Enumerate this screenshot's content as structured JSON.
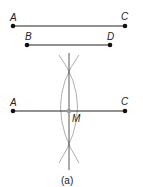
{
  "diagram": {
    "caption": "(a)",
    "segment_AC_top": {
      "start_label": "A",
      "end_label": "C"
    },
    "segment_BD": {
      "start_label": "B",
      "end_label": "D"
    },
    "segment_AC_bottom": {
      "start_label": "A",
      "end_label": "C",
      "midpoint_label": "M"
    },
    "colors": {
      "line": "#222222",
      "arc": "#999999",
      "midpoint": "#999999"
    }
  }
}
